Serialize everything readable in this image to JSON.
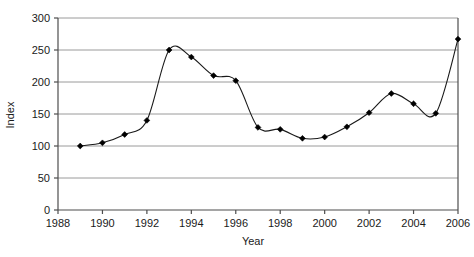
{
  "chart_data": {
    "type": "line",
    "title": "",
    "xlabel": "Year",
    "ylabel": "Index",
    "xlim": [
      1988,
      2006
    ],
    "ylim": [
      0,
      300
    ],
    "grid": true,
    "grid_axis": "y",
    "legend": "none",
    "marker": "diamond",
    "line_color": "#1a1a1a",
    "marker_color": "#000000",
    "grid_color": "#9a9a9a",
    "axis_color": "#4d4d4d",
    "background": "#ffffff",
    "x_ticks": [
      1988,
      1990,
      1992,
      1994,
      1996,
      1998,
      2000,
      2002,
      2004,
      2006
    ],
    "x_tick_labels": [
      "1988",
      "1990",
      "1992",
      "1994",
      "1996",
      "1998",
      "2000",
      "2002",
      "2004",
      "2006"
    ],
    "y_ticks": [
      0,
      50,
      100,
      150,
      200,
      250,
      300
    ],
    "y_tick_labels": [
      "0",
      "50",
      "100",
      "150",
      "200",
      "250",
      "300"
    ],
    "x": [
      1989,
      1990,
      1991,
      1992,
      1993,
      1994,
      1995,
      1996,
      1997,
      1998,
      1999,
      2000,
      2001,
      2002,
      2003,
      2004,
      2005,
      2006
    ],
    "values": [
      100,
      105,
      118,
      140,
      250,
      239,
      210,
      202,
      129,
      126,
      112,
      114,
      130,
      152,
      182,
      166,
      151,
      267
    ],
    "series": [
      {
        "name": "Index",
        "values": [
          100,
          105,
          118,
          140,
          250,
          239,
          210,
          202,
          129,
          126,
          112,
          114,
          130,
          152,
          182,
          166,
          151,
          267
        ]
      }
    ]
  },
  "labels": {
    "x_axis_title": "Year",
    "y_axis_title": "Index"
  }
}
